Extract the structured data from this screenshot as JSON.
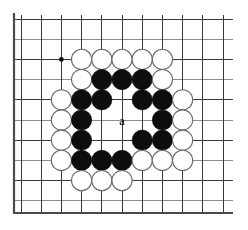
{
  "figure": {
    "kind": "go-board-diagram",
    "background_color": "#ffffff"
  },
  "board": {
    "origin_x": 21,
    "origin_y": 19,
    "spacing": 20.2,
    "cols": 11,
    "rows": 10,
    "line_color": "#3a3a3a",
    "soft_line_color": "#8d8d8d",
    "border_color": "#4a4a4a",
    "soft_rows": [
      1,
      3,
      5,
      7,
      9
    ],
    "soft_cols": [],
    "border_left_x": 14,
    "border_bottom_y": 213
  },
  "star_points": [
    {
      "col": 2,
      "row": 2
    },
    {
      "col": 7,
      "row": 2
    },
    {
      "col": 2,
      "row": 7
    },
    {
      "col": 7,
      "row": 7
    }
  ],
  "stones": {
    "black_color": "#0d0d0d",
    "white_color": "#ffffff",
    "radius": 10.1,
    "list": [
      {
        "col": 3,
        "row": 2,
        "color": "white"
      },
      {
        "col": 4,
        "row": 2,
        "color": "white"
      },
      {
        "col": 5,
        "row": 2,
        "color": "white"
      },
      {
        "col": 6,
        "row": 2,
        "color": "white"
      },
      {
        "col": 7,
        "row": 2,
        "color": "white"
      },
      {
        "col": 3,
        "row": 3,
        "color": "white"
      },
      {
        "col": 4,
        "row": 3,
        "color": "black"
      },
      {
        "col": 5,
        "row": 3,
        "color": "black"
      },
      {
        "col": 6,
        "row": 3,
        "color": "black"
      },
      {
        "col": 7,
        "row": 3,
        "color": "white"
      },
      {
        "col": 2,
        "row": 4,
        "color": "white"
      },
      {
        "col": 3,
        "row": 4,
        "color": "black"
      },
      {
        "col": 4,
        "row": 4,
        "color": "black"
      },
      {
        "col": 6,
        "row": 4,
        "color": "black"
      },
      {
        "col": 7,
        "row": 4,
        "color": "black"
      },
      {
        "col": 8,
        "row": 4,
        "color": "white"
      },
      {
        "col": 2,
        "row": 5,
        "color": "white"
      },
      {
        "col": 3,
        "row": 5,
        "color": "black"
      },
      {
        "col": 7,
        "row": 5,
        "color": "black"
      },
      {
        "col": 8,
        "row": 5,
        "color": "white"
      },
      {
        "col": 2,
        "row": 6,
        "color": "white"
      },
      {
        "col": 3,
        "row": 6,
        "color": "black"
      },
      {
        "col": 6,
        "row": 6,
        "color": "black"
      },
      {
        "col": 7,
        "row": 6,
        "color": "black"
      },
      {
        "col": 8,
        "row": 6,
        "color": "white"
      },
      {
        "col": 2,
        "row": 7,
        "color": "white"
      },
      {
        "col": 3,
        "row": 7,
        "color": "black"
      },
      {
        "col": 4,
        "row": 7,
        "color": "black"
      },
      {
        "col": 5,
        "row": 7,
        "color": "black"
      },
      {
        "col": 6,
        "row": 7,
        "color": "white"
      },
      {
        "col": 7,
        "row": 7,
        "color": "white"
      },
      {
        "col": 8,
        "row": 7,
        "color": "white"
      },
      {
        "col": 3,
        "row": 8,
        "color": "white"
      },
      {
        "col": 4,
        "row": 8,
        "color": "white"
      },
      {
        "col": 5,
        "row": 8,
        "color": "white"
      }
    ]
  },
  "labels": [
    {
      "text": "a",
      "col": 5,
      "row": 5,
      "color": "#000000"
    }
  ]
}
